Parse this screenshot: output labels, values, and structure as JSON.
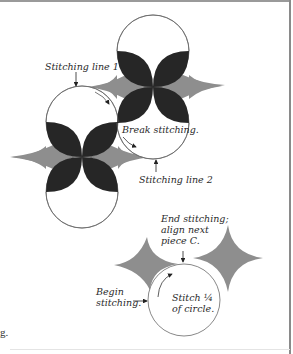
{
  "figure": {
    "upper_diagram": {
      "labels": {
        "stitching_line_1": "Stitching line 1",
        "break_stitching": "Break stitching.",
        "stitching_line_2": "Stitching line 2"
      }
    },
    "lower_diagram": {
      "labels": {
        "end_stitching": "End stitching;\nalign next\npiece C.",
        "begin_stitching": "Begin\nstitching.",
        "stitch_quarter": "Stitch ¼\nof circle."
      }
    },
    "colors": {
      "petal_dark": "#262626",
      "star_gray": "#8e8e8e",
      "outline": "#6a6a6a",
      "background": "#ffffff"
    }
  },
  "page_fragments": {
    "left_edge_text": "g."
  }
}
